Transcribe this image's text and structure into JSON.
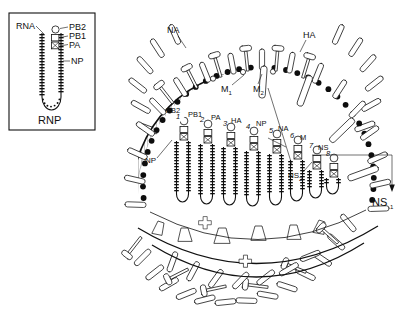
{
  "figure": {
    "colors": {
      "ink": "#111111",
      "bead": "#0d0d0d",
      "hatch": "#666666",
      "paper": "#ffffff"
    }
  },
  "inset": {
    "name": "RNP detail",
    "caption": "RNP",
    "labels": {
      "rna": "RNA",
      "pb2": "PB2",
      "pb1": "PB1",
      "pa": "PA",
      "np": "NP"
    }
  },
  "virion": {
    "labels": {
      "na": "NA",
      "ha": "HA",
      "m1": "M",
      "m1_sub": "1",
      "m2": "M",
      "m2_sub": "2",
      "np": "NP",
      "ns": "NS",
      "ns2": "NS",
      "ns2_sub": "2",
      "ns1": "NS",
      "ns1_sub": "1"
    },
    "polymerase_labels": {
      "pb2": "PB2",
      "pb1": "PB1",
      "pa": "PA"
    },
    "segments": [
      {
        "number": "1",
        "gene": ""
      },
      {
        "number": "2",
        "gene": ""
      },
      {
        "number": "3",
        "gene": ""
      },
      {
        "number": "4",
        "gene": "HA"
      },
      {
        "number": "5",
        "gene": "NP"
      },
      {
        "number": "6",
        "gene": "NA"
      },
      {
        "number": "7",
        "gene": "M"
      },
      {
        "number": "8",
        "gene": "NS"
      }
    ],
    "segment_gene_labels": [
      "HA",
      "NP",
      "NA",
      "M",
      "NS"
    ]
  }
}
